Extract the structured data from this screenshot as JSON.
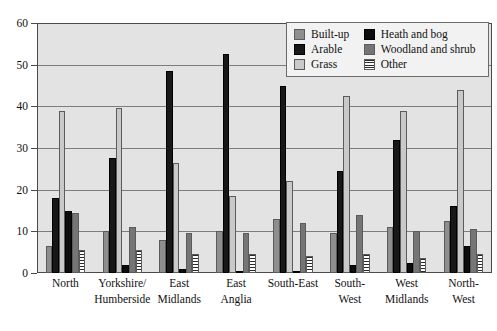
{
  "chart_data": {
    "type": "bar",
    "title": "",
    "xlabel": "",
    "ylabel": "",
    "ylim": [
      0,
      60
    ],
    "yticks": [
      0,
      10,
      20,
      30,
      40,
      50,
      60
    ],
    "grid": true,
    "legend_position": "top-right",
    "categories": [
      "North",
      "Yorkshire/ Humberside",
      "East Midlands",
      "East Anglia",
      "South-East",
      "South- West",
      "West Midlands",
      "North- West"
    ],
    "category_lines": [
      [
        "North"
      ],
      [
        "Yorkshire/",
        "Humberside"
      ],
      [
        "East",
        "Midlands"
      ],
      [
        "East",
        "Anglia"
      ],
      [
        "South-East"
      ],
      [
        "South-",
        "West"
      ],
      [
        "West",
        "Midlands"
      ],
      [
        "North-",
        "West"
      ]
    ],
    "series": [
      {
        "name": "Built-up",
        "key": "builtup",
        "color": "#8e8e8e",
        "values": [
          6.5,
          10.0,
          8.0,
          10.0,
          13.0,
          9.5,
          11.0,
          12.5
        ]
      },
      {
        "name": "Arable",
        "key": "arable",
        "color": "#181818",
        "values": [
          18.0,
          27.5,
          48.5,
          52.5,
          45.0,
          24.5,
          32.0,
          16.0
        ]
      },
      {
        "name": "Grass",
        "key": "grass",
        "color": "#c9c9c9",
        "values": [
          39.0,
          39.5,
          26.5,
          18.5,
          22.0,
          42.5,
          39.0,
          44.0
        ]
      },
      {
        "name": "Heath and bog",
        "key": "heath",
        "color": "#0d0d0d",
        "values": [
          15.0,
          2.0,
          1.0,
          0.3,
          0.5,
          2.0,
          2.5,
          6.5
        ]
      },
      {
        "name": "Woodland and shrub",
        "key": "woodland",
        "color": "#757575",
        "values": [
          14.5,
          11.0,
          9.5,
          9.5,
          12.0,
          14.0,
          10.0,
          10.5
        ]
      },
      {
        "name": "Other",
        "key": "other",
        "color": "#ffffff",
        "values": [
          5.5,
          5.5,
          4.5,
          4.5,
          4.0,
          4.5,
          3.5,
          4.5
        ]
      }
    ]
  },
  "legend": {
    "items": [
      {
        "label": "Built-up",
        "key": "builtup"
      },
      {
        "label": "Heath and bog",
        "key": "heath"
      },
      {
        "label": "Arable",
        "key": "arable"
      },
      {
        "label": "Woodland and shrub",
        "key": "woodland"
      },
      {
        "label": "Grass",
        "key": "grass"
      },
      {
        "label": "Other",
        "key": "other"
      }
    ]
  }
}
